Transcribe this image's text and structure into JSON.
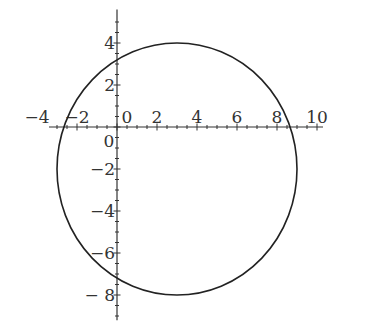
{
  "chart_data": {
    "type": "line",
    "title": "",
    "xlabel": "",
    "ylabel": "",
    "curve": {
      "shape": "circle",
      "center": [
        3,
        -2
      ],
      "radius": 6
    },
    "xlim": [
      -4,
      10
    ],
    "ylim": [
      -9,
      5
    ],
    "grid": false,
    "legend": null,
    "x_ticks": [
      -4,
      -2,
      0,
      2,
      4,
      6,
      8,
      10
    ],
    "x_tick_labels": [
      "-4",
      "-2",
      "0",
      "2",
      "4",
      "6",
      "8",
      "10"
    ],
    "y_ticks": [
      4,
      2,
      0,
      -2,
      -4,
      -6,
      -8
    ],
    "y_tick_labels": [
      "4",
      "2",
      "0",
      "-2",
      "-4",
      "-6",
      "- 8"
    ],
    "intercepts": {
      "x": [
        -2.66,
        8.66
      ],
      "y": [
        3.2,
        -7.2
      ]
    },
    "colors": {
      "curve": "#222222",
      "axes": "#333333"
    }
  }
}
